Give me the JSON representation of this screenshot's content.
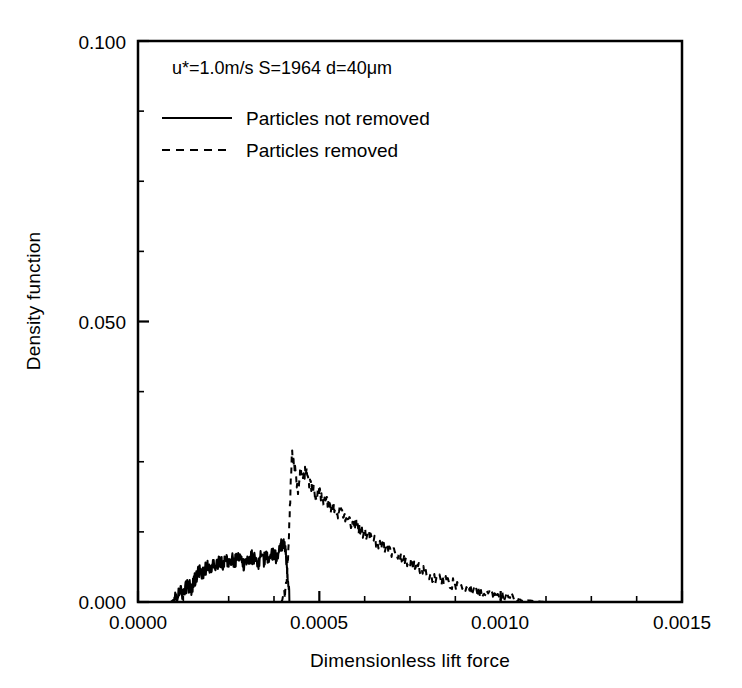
{
  "chart_data": {
    "type": "line",
    "title": "",
    "annotation": "u*=1.0m/s S=1964 d=40μm",
    "xlabel": "Dimensionless lift force",
    "ylabel": "Density function",
    "xlim": [
      0.0,
      0.0015
    ],
    "ylim": [
      0.0,
      0.1
    ],
    "xticks": [
      0.0,
      0.0005,
      0.001,
      0.0015
    ],
    "xtick_labels": [
      "0.0000",
      "0.0005",
      "0.0010",
      "0.0015"
    ],
    "yticks": [
      0.0,
      0.05,
      0.1
    ],
    "ytick_labels": [
      "0.000",
      "0.050",
      "0.100"
    ],
    "xminor_step": 0.000125,
    "yminor_step": 0.0125,
    "grid": false,
    "legend_position": "upper-left",
    "series": [
      {
        "name": "Particles not removed",
        "style": "solid",
        "color": "#000000",
        "x": [
          9e-05,
          9.8e-05,
          0.000106,
          0.000114,
          0.000122,
          0.00013,
          0.000138,
          0.000146,
          0.000154,
          0.000162,
          0.00017,
          0.000178,
          0.000186,
          0.000194,
          0.000202,
          0.00021,
          0.000218,
          0.000226,
          0.000234,
          0.000242,
          0.00025,
          0.000258,
          0.000266,
          0.000274,
          0.000282,
          0.00029,
          0.000298,
          0.000306,
          0.000314,
          0.000322,
          0.00033,
          0.000338,
          0.000346,
          0.000354,
          0.000362,
          0.00037,
          0.000378,
          0.000386,
          0.000394,
          0.0004,
          0.000406,
          0.00041,
          0.000414,
          0.000418
        ],
        "y": [
          0.0,
          0.0004,
          0.0011,
          0.0019,
          0.0014,
          0.0026,
          0.0032,
          0.0022,
          0.0038,
          0.0047,
          0.0055,
          0.0048,
          0.006,
          0.0068,
          0.0059,
          0.0071,
          0.0064,
          0.0073,
          0.0066,
          0.0076,
          0.0069,
          0.0078,
          0.007,
          0.008,
          0.0072,
          0.0067,
          0.0077,
          0.0071,
          0.0081,
          0.0074,
          0.0069,
          0.0079,
          0.0073,
          0.0083,
          0.0076,
          0.0086,
          0.0079,
          0.0089,
          0.0098,
          0.0104,
          0.0092,
          0.007,
          0.0035,
          0.0
        ]
      },
      {
        "name": "Particles removed",
        "style": "dashed",
        "color": "#000000",
        "x": [
          0.000395,
          0.000405,
          0.000412,
          0.000418,
          0.000424,
          0.000432,
          0.00044,
          0.000448,
          0.000456,
          0.000464,
          0.000472,
          0.00048,
          0.00049,
          0.0005,
          0.00051,
          0.00052,
          0.00053,
          0.00054,
          0.00055,
          0.00056,
          0.00057,
          0.00058,
          0.00059,
          0.0006,
          0.00061,
          0.00062,
          0.000635,
          0.00065,
          0.000665,
          0.00068,
          0.000695,
          0.00071,
          0.000725,
          0.00074,
          0.000755,
          0.00077,
          0.000785,
          0.0008,
          0.00082,
          0.00084,
          0.00086,
          0.00088,
          0.0009,
          0.00092,
          0.00094,
          0.00096,
          0.00098,
          0.001,
          0.00103,
          0.00106,
          0.00109,
          0.00112
        ],
        "y": [
          0.0,
          0.0012,
          0.006,
          0.015,
          0.0265,
          0.0243,
          0.0198,
          0.0232,
          0.0221,
          0.0238,
          0.021,
          0.0205,
          0.0188,
          0.0196,
          0.0175,
          0.0182,
          0.0166,
          0.0172,
          0.0158,
          0.0167,
          0.0152,
          0.0146,
          0.0138,
          0.0143,
          0.013,
          0.0125,
          0.0118,
          0.0112,
          0.0104,
          0.0098,
          0.0091,
          0.0085,
          0.0079,
          0.0072,
          0.0068,
          0.0061,
          0.0056,
          0.005,
          0.0044,
          0.0039,
          0.0034,
          0.003,
          0.0025,
          0.0021,
          0.0018,
          0.0015,
          0.0012,
          0.0009,
          0.0006,
          0.0004,
          0.0002,
          0.0
        ]
      }
    ]
  },
  "legend": {
    "entries": [
      {
        "label": "Particles not removed",
        "style": "solid"
      },
      {
        "label": "Particles removed",
        "style": "dashed"
      }
    ]
  }
}
